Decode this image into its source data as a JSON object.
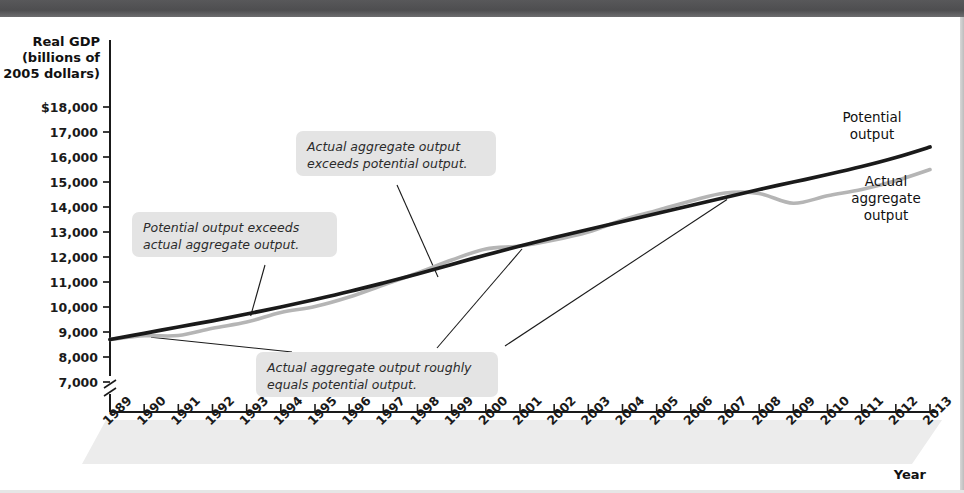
{
  "figure": {
    "background": "#ffffff",
    "top_band_color": "#55555 7",
    "axis_color": "#1a1a1a"
  },
  "axes": {
    "y_title_lines": [
      "Real GDP",
      "(billions of",
      "2005 dollars)"
    ],
    "x_title": "Year",
    "y_ticks": [
      "$18,000",
      "17,000",
      "16,000",
      "15,000",
      "14,000",
      "13,000",
      "12,000",
      "11,000",
      "10,000",
      "9,000",
      "8,000",
      "7,000"
    ],
    "y_tick_values": [
      18000,
      17000,
      16000,
      15000,
      14000,
      13000,
      12000,
      11000,
      10000,
      9000,
      8000,
      7000
    ],
    "y_axis_break": true,
    "x_ticks": [
      "1989",
      "1990",
      "1991",
      "1992",
      "1993",
      "1994",
      "1995",
      "1996",
      "1997",
      "1998",
      "1999",
      "2000",
      "2001",
      "2002",
      "2003",
      "2004",
      "2005",
      "2006",
      "2007",
      "2008",
      "2009",
      "2010",
      "2011",
      "2012",
      "2013"
    ]
  },
  "series_labels": {
    "potential": [
      "Potential",
      "output"
    ],
    "actual": [
      "Actual",
      "aggregate",
      "output"
    ]
  },
  "callouts": [
    {
      "id": "potential-exceeds-actual",
      "lines": [
        "Potential output exceeds",
        "actual aggregate output."
      ]
    },
    {
      "id": "actual-exceeds-potential",
      "lines": [
        "Actual aggregate output",
        "exceeds potential output."
      ]
    },
    {
      "id": "actual-equals-potential",
      "lines": [
        "Actual aggregate output roughly",
        "equals potential output."
      ]
    }
  ],
  "chart_data": {
    "type": "line",
    "title": "",
    "xlabel": "Year",
    "ylabel": "Real GDP (billions of 2005 dollars)",
    "xlim": [
      1989,
      2013
    ],
    "ylim": [
      6750,
      18000
    ],
    "grid": false,
    "legend": "inline-right",
    "colors": {
      "potential": "#1a1a1a",
      "actual": "#b5b5b5"
    },
    "x": [
      1989,
      1990,
      1991,
      1992,
      1993,
      1994,
      1995,
      1996,
      1997,
      1998,
      1999,
      2000,
      2001,
      2002,
      2003,
      2004,
      2005,
      2006,
      2007,
      2008,
      2009,
      2010,
      2011,
      2012,
      2013
    ],
    "series": [
      {
        "name": "Potential output",
        "values": [
          8700,
          8950,
          9200,
          9450,
          9720,
          10000,
          10300,
          10620,
          10960,
          11320,
          11700,
          12080,
          12440,
          12780,
          13100,
          13420,
          13740,
          14060,
          14380,
          14700,
          15000,
          15300,
          15620,
          15980,
          16400
        ]
      },
      {
        "name": "Actual aggregate output",
        "values": [
          8700,
          8850,
          8860,
          9150,
          9400,
          9780,
          10020,
          10400,
          10880,
          11360,
          11880,
          12320,
          12440,
          12680,
          13000,
          13480,
          13860,
          14240,
          14560,
          14540,
          14150,
          14450,
          14700,
          15050,
          15500
        ]
      }
    ],
    "annotations": [
      {
        "text": "Potential output exceeds actual aggregate output.",
        "points_to_year": 1993
      },
      {
        "text": "Actual aggregate output exceeds potential output.",
        "points_to_year": 1999
      },
      {
        "text": "Actual aggregate output roughly equals potential output.",
        "points_to_years": [
          1990,
          2001,
          2007
        ]
      }
    ]
  }
}
